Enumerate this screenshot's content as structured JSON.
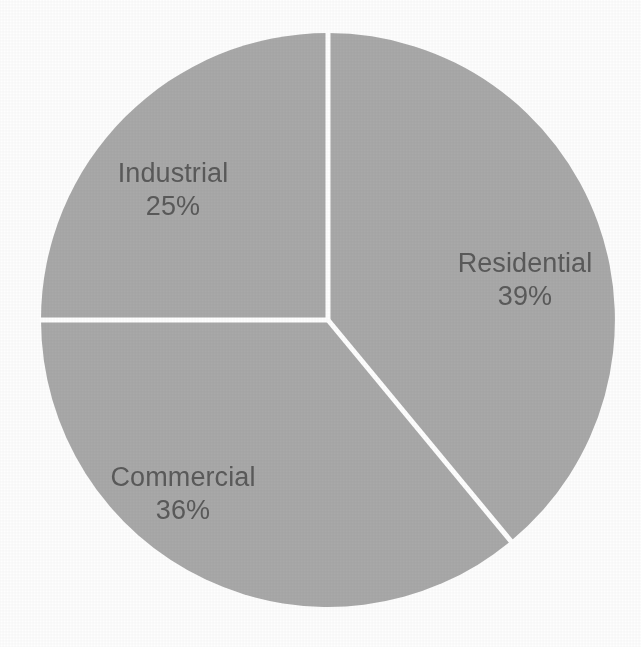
{
  "figure": {
    "kind": "pie-chart",
    "background_color": "#fefefe",
    "slice_fill_color": "#a9a9a9",
    "divider_color": "#ffffff",
    "label_color": "#595959"
  },
  "chart_data": {
    "type": "pie",
    "title": "",
    "subtitle": "",
    "xlabel": "",
    "ylabel": "",
    "legend_position": "none",
    "grid": false,
    "labels_inside_slices": true,
    "start_angle_deg": 0,
    "direction": "clockwise",
    "categories": [
      "Residential",
      "Commercial",
      "Industrial"
    ],
    "values": [
      39,
      36,
      25
    ],
    "value_unit": "%",
    "total": 100,
    "colors": [
      "#a9a9a9",
      "#a9a9a9",
      "#a9a9a9"
    ],
    "slices": [
      {
        "label": "Residential",
        "value": 39,
        "value_text": "39%",
        "start_angle_deg": 0,
        "end_angle_deg": 140.4,
        "color": "#a9a9a9"
      },
      {
        "label": "Commercial",
        "value": 36,
        "value_text": "36%",
        "start_angle_deg": 140.4,
        "end_angle_deg": 270.0,
        "color": "#a9a9a9"
      },
      {
        "label": "Industrial",
        "value": 25,
        "value_text": "25%",
        "start_angle_deg": 270.0,
        "end_angle_deg": 360.0,
        "color": "#a9a9a9"
      }
    ]
  },
  "labels": {
    "residential": {
      "name": "Residential",
      "value_text": "39%"
    },
    "commercial": {
      "name": "Commercial",
      "value_text": "36%"
    },
    "industrial": {
      "name": "Industrial",
      "value_text": "25%"
    }
  }
}
